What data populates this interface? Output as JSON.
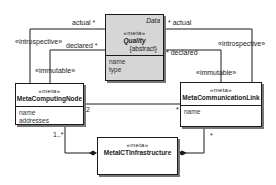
{
  "diagram": {
    "type": "uml-class-diagram",
    "classes": [
      {
        "id": "quality",
        "package": "Data",
        "stereotype": "«meta»",
        "name": "Quality",
        "modifier": "{abstract}",
        "attributes": [
          "name",
          "type"
        ],
        "fill": "#d6d6d6"
      },
      {
        "id": "computing-node",
        "stereotype": "«meta»",
        "name": "MetaComputingNode",
        "attributes": [
          "name",
          "addresses"
        ],
        "fill": "#ffffff"
      },
      {
        "id": "communication-link",
        "stereotype": "«meta»",
        "name": "MetaCommunicationLink",
        "attributes": [
          "name"
        ],
        "fill": "#ffffff"
      },
      {
        "id": "ict-infrastructure",
        "stereotype": "«meta»",
        "name": "MetaICTInfrastructure",
        "attributes": [],
        "fill": "#ffffff"
      }
    ],
    "associations": [
      {
        "from": "computing-node",
        "to": "quality",
        "stereotype": "«introspective»",
        "role": "actual",
        "multiplicity": "*"
      },
      {
        "from": "computing-node",
        "to": "quality",
        "stereotype": "«immutable»",
        "role": "declared",
        "multiplicity": "*"
      },
      {
        "from": "communication-link",
        "to": "quality",
        "stereotype": "«introspective»",
        "role": "actual",
        "multiplicity": "*"
      },
      {
        "from": "communication-link",
        "to": "quality",
        "stereotype": "«immutable»",
        "role": "declared",
        "multiplicity": "*"
      },
      {
        "from": "computing-node",
        "to": "communication-link",
        "multiplicity_from": "2",
        "multiplicity_to": "*"
      },
      {
        "from": "ict-infrastructure",
        "to": "computing-node",
        "kind": "composition",
        "multiplicity": "1..*"
      },
      {
        "from": "ict-infrastructure",
        "to": "communication-link",
        "kind": "composition",
        "multiplicity": "*"
      }
    ]
  },
  "labels": {
    "left_introspective": "«introspective»",
    "left_immutable": "«immutable»",
    "left_actual": "actual  *",
    "left_declared": "declared  *",
    "right_introspective": "«introspective»",
    "right_immutable": "«immutable»",
    "right_actual": "*  actual",
    "right_declared": "*  declared",
    "node_link_from_mult": "2",
    "node_link_to_mult": "*",
    "infra_node_mult": "1..*",
    "infra_link_mult": "*"
  },
  "colors": {
    "line": "#1a1a1a",
    "quality_fill": "#d6d6d6",
    "shadow": "#777777"
  }
}
